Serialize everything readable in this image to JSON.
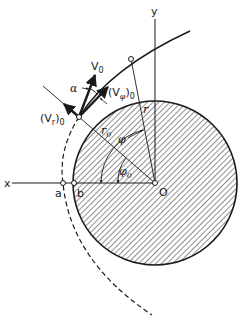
{
  "figure": {
    "type": "orbital-mechanics-diagram",
    "colors": {
      "ink": "#1a1a1a",
      "background": "#ffffff",
      "hatch": "#333333"
    }
  },
  "axes": {
    "x_label": "x",
    "y_label": "y",
    "origin_label": "O"
  },
  "points": {
    "a_label": "a",
    "b_label": "b"
  },
  "vectors": {
    "v0": {
      "main": "V",
      "sub": "0"
    },
    "vr0": {
      "open": "(V",
      "sub_inner": "r",
      "close": ")",
      "sub": "0"
    },
    "vphi0": {
      "open": "(V",
      "sub_inner": "φ",
      "close": ")",
      "sub": "0"
    }
  },
  "angles": {
    "alpha": "α",
    "phi": "φ",
    "phi0": {
      "main": "φ",
      "sub": "0"
    }
  },
  "radii": {
    "r": "r",
    "r0": {
      "main": "r",
      "sub": "0"
    }
  },
  "elements": {
    "body": "hatched circular planet centered at O",
    "trajectory": "solid curved path from launch point upward to the right",
    "trajectory_extension": "dashed curve continuing the conic below the launch point through a"
  }
}
